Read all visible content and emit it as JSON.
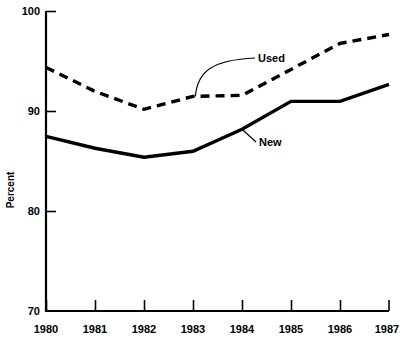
{
  "chart_data": {
    "type": "line",
    "title": "",
    "subtitle": "",
    "xlabel": "",
    "ylabel": "Percent",
    "categories": [
      "1980",
      "1981",
      "1982",
      "1983",
      "1984",
      "1985",
      "1986",
      "1987"
    ],
    "x": [
      1980,
      1981,
      1982,
      1983,
      1984,
      1985,
      1986,
      1987
    ],
    "xlim": [
      1980,
      1987
    ],
    "ylim": [
      70,
      100
    ],
    "yticks": [
      70,
      80,
      90,
      100
    ],
    "ytick_labels": [
      "70",
      "80",
      "90",
      "100"
    ],
    "xticks": [
      1980,
      1981,
      1982,
      1983,
      1984,
      1985,
      1986,
      1987
    ],
    "xtick_labels": [
      "1980",
      "1981",
      "1982",
      "1983",
      "1984",
      "1985",
      "1986",
      "1987"
    ],
    "grid": false,
    "legend": "inline-annotations",
    "legend_position": "inline",
    "series": [
      {
        "name": "Used",
        "style": "dashed",
        "color": "#000000",
        "values": [
          94.4,
          92.0,
          90.2,
          91.5,
          91.6,
          94.2,
          96.8,
          97.7
        ]
      },
      {
        "name": "New",
        "style": "solid",
        "color": "#000000",
        "values": [
          87.5,
          86.3,
          85.4,
          86.0,
          88.2,
          91.0,
          91.0,
          92.7
        ]
      }
    ],
    "annotations": [
      {
        "text": "Used",
        "series": "Used",
        "anchor_year": 1983.05,
        "anchor_value": 91.5
      },
      {
        "text": "New",
        "series": "New",
        "anchor_year": 1984.0,
        "anchor_value": 88.2
      }
    ]
  },
  "axis": {
    "y_axis_label": "Percent",
    "y_top_label": "100",
    "y_bottom_label": "70"
  },
  "colors": {
    "ink": "#000000",
    "background": "#ffffff"
  }
}
